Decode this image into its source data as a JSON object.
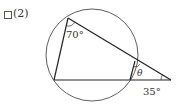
{
  "problem": {
    "number_label": "(2)",
    "checkbox_checked": false
  },
  "figure": {
    "type": "circle-secant-diagram",
    "circle": {
      "cx": 92,
      "cy": 55,
      "r": 46
    },
    "points": {
      "A": [
        68,
        18
      ],
      "B": [
        54,
        80
      ],
      "C": [
        135,
        61
      ],
      "D": [
        130,
        80
      ],
      "P": [
        171,
        80
      ]
    },
    "angle_labels": {
      "at_A": "70°",
      "at_C": "θ",
      "at_P": "35°"
    },
    "stroke_color": "#333333"
  }
}
